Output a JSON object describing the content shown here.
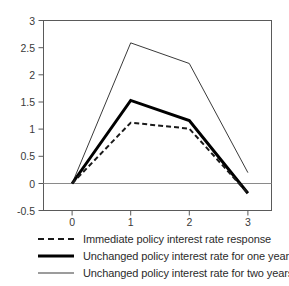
{
  "chart_data": {
    "type": "line",
    "title": "",
    "xlabel": "",
    "ylabel": "",
    "x": [
      0,
      1,
      2,
      3
    ],
    "xtick_labels": [
      "0",
      "1",
      "2",
      "3"
    ],
    "ytick_labels": [
      "3",
      "2.5",
      "2",
      "1.5",
      "1",
      "0.5",
      "0",
      "-0.5"
    ],
    "ytick_values": [
      3,
      2.5,
      2,
      1.5,
      1,
      0.5,
      0,
      -0.5
    ],
    "xlim": [
      -0.5,
      3.5
    ],
    "ylim": [
      -0.5,
      3
    ],
    "grid": false,
    "zero_line": true,
    "legend_position": "below",
    "series": [
      {
        "name": "Immediate policy interest rate response",
        "style": "dashed",
        "color": "#1a1a1a",
        "values": [
          0,
          1.12,
          1.01,
          -0.18
        ]
      },
      {
        "name": "Unchanged policy interest rate for one year",
        "style": "bold-solid",
        "color": "#000000",
        "values": [
          0,
          1.53,
          1.16,
          -0.18
        ]
      },
      {
        "name": "Unchanged policy interest rate for two years",
        "style": "thin-solid",
        "color": "#3a3a3a",
        "values": [
          0,
          2.59,
          2.21,
          0.2
        ]
      }
    ]
  },
  "legend": {
    "items": [
      {
        "label": "Immediate policy interest rate response",
        "key": "dashed-line-key"
      },
      {
        "label": "Unchanged policy interest rate for one year",
        "key": "bold-line-key"
      },
      {
        "label": "Unchanged policy interest rate for two years",
        "key": "thin-line-key"
      }
    ]
  },
  "axes": {
    "y_labels": [
      "3",
      "2.5",
      "2",
      "1.5",
      "1",
      "0.5",
      "0",
      "-0.5"
    ],
    "x_labels": [
      "0",
      "1",
      "2",
      "3"
    ]
  }
}
